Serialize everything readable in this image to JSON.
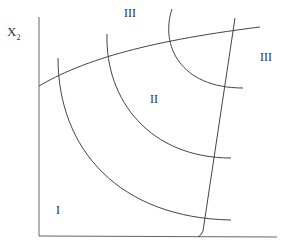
{
  "diagram": {
    "axis_label_y": {
      "main": "X",
      "sub": "2"
    },
    "regions": [
      {
        "id": "region-III-top",
        "label": "III"
      },
      {
        "id": "region-III-right",
        "label": "III"
      },
      {
        "id": "region-II",
        "label": "II"
      },
      {
        "id": "region-I",
        "label": "I"
      }
    ],
    "colors": {
      "line": "#444444",
      "axis": "#555555",
      "text": "#333333"
    }
  }
}
